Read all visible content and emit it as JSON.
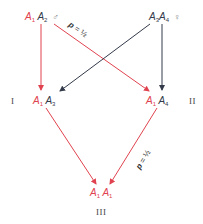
{
  "diagram": {
    "type": "genetic-cross",
    "colors": {
      "red": "#e0434f",
      "black": "#333a4a",
      "background": "#ffffff"
    },
    "nodes": {
      "parent_male": {
        "allele1": "A",
        "sub1": "1",
        "allele2": "A",
        "sub2": "2",
        "sex_symbol": "♂"
      },
      "parent_female": {
        "allele1": "A",
        "sub1": "3",
        "allele2": "A",
        "sub2": "4",
        "sex_symbol": "♀"
      },
      "child_one": {
        "allele1": "A",
        "sub1": "1",
        "allele2": "A",
        "sub2": "3",
        "label": "I"
      },
      "child_two": {
        "allele1": "A",
        "sub1": "1",
        "allele2": "A",
        "sub2": "4",
        "label": "II"
      },
      "grandchild": {
        "allele1": "A",
        "sub1": "1",
        "allele2": "A",
        "sub2": "1",
        "label": "III"
      }
    },
    "edges": [
      {
        "from": "parent_male",
        "to": "child_one",
        "color": "red"
      },
      {
        "from": "parent_male",
        "to": "child_two",
        "color": "red",
        "probability": "p = ½"
      },
      {
        "from": "parent_female",
        "to": "child_one",
        "color": "black"
      },
      {
        "from": "parent_female",
        "to": "child_two",
        "color": "black"
      },
      {
        "from": "child_one",
        "to": "grandchild",
        "color": "red"
      },
      {
        "from": "child_two",
        "to": "grandchild",
        "color": "red",
        "probability": "p = ½"
      }
    ],
    "probability_labels": {
      "upper": {
        "p": "p",
        "eq": " = ",
        "value": "½"
      },
      "lower": {
        "p": "p",
        "eq": " = ",
        "value": "½"
      }
    }
  }
}
